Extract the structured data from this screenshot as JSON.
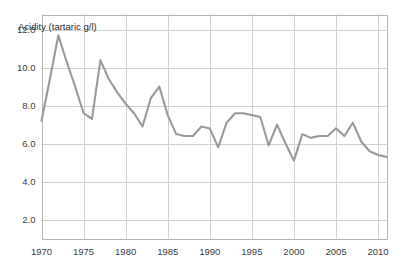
{
  "chart_data": {
    "type": "line",
    "title": "Acidity (tartaric g/l)",
    "xlabel": "",
    "ylabel": "Acidity (tartaric g/l)",
    "xlim": [
      1970,
      2011
    ],
    "ylim": [
      1.0,
      12.8
    ],
    "grid": true,
    "legend": false,
    "legend_position": "none",
    "line_color": "#9a9a9a",
    "grid_color": "#d0d0d0",
    "axis_color": "#b4b4b4",
    "background_color": "#ffffff",
    "yticks": [
      2.0,
      4.0,
      6.0,
      8.0,
      10.0,
      12.0
    ],
    "ytick_labels": [
      "2.0",
      "4.0",
      "6.0",
      "8.0",
      "10.0",
      "12.0"
    ],
    "xticks": [
      1970,
      1975,
      1980,
      1985,
      1990,
      1995,
      2000,
      2005,
      2010
    ],
    "xtick_labels": [
      "1970",
      "1975",
      "1980",
      "1985",
      "1990",
      "1995",
      "2000",
      "2005",
      "2010"
    ],
    "x": [
      1970,
      1971,
      1972,
      1973,
      1974,
      1975,
      1976,
      1977,
      1978,
      1979,
      1980,
      1981,
      1982,
      1983,
      1984,
      1985,
      1986,
      1987,
      1988,
      1989,
      1990,
      1991,
      1992,
      1993,
      1994,
      1995,
      1996,
      1997,
      1998,
      1999,
      2000,
      2001,
      2002,
      2003,
      2004,
      2005,
      2006,
      2007,
      2008,
      2009,
      2010,
      2011
    ],
    "values": [
      7.2,
      9.4,
      11.7,
      10.3,
      9.0,
      7.6,
      7.3,
      10.4,
      9.4,
      8.7,
      8.1,
      7.6,
      6.9,
      8.4,
      9.0,
      7.5,
      6.5,
      6.4,
      6.4,
      6.9,
      6.8,
      5.8,
      7.1,
      7.6,
      7.6,
      7.5,
      7.4,
      5.9,
      7.0,
      6.0,
      5.1,
      6.5,
      6.3,
      6.4,
      6.4,
      6.8,
      6.4,
      7.1,
      6.1,
      5.6,
      5.4,
      5.3
    ],
    "series_name": "Acidity"
  }
}
